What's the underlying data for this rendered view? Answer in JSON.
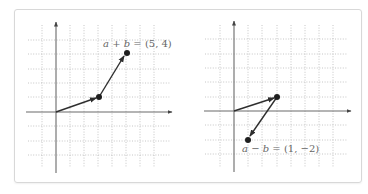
{
  "diagrams": [
    {
      "name": "vector-sum",
      "origin_px": [
        56,
        112
      ],
      "unit_px": 14.3,
      "vectors": [
        {
          "name": "a",
          "from": [
            0,
            0
          ],
          "to": [
            3,
            1
          ]
        },
        {
          "name": "b",
          "from": [
            3,
            1
          ],
          "to": [
            5,
            4
          ]
        }
      ],
      "points": [
        [
          3,
          1
        ],
        [
          5,
          4
        ]
      ],
      "label": {
        "var1": "a",
        "op": "+",
        "var2": "b",
        "rest": "= (5, 4)",
        "text": "a + b = (5, 4)"
      }
    },
    {
      "name": "vector-difference",
      "origin_px": [
        234,
        111
      ],
      "unit_px": 14.3,
      "vectors": [
        {
          "name": "a",
          "from": [
            0,
            0
          ],
          "to": [
            3,
            1
          ]
        },
        {
          "name": "-b",
          "from": [
            3,
            1
          ],
          "to": [
            1,
            -2
          ]
        }
      ],
      "points": [
        [
          3,
          1
        ],
        [
          1,
          -2
        ]
      ],
      "label": {
        "var1": "a",
        "op": "−",
        "var2": "b",
        "rest": "= (1, −2)",
        "text": "a − b = (1, −2)"
      }
    }
  ],
  "colors": {
    "grid": "#b8b8b8",
    "axis": "#6a6a6a",
    "vector": "#2e2e2e",
    "label": "#666666",
    "border": "#d8d8d8"
  }
}
